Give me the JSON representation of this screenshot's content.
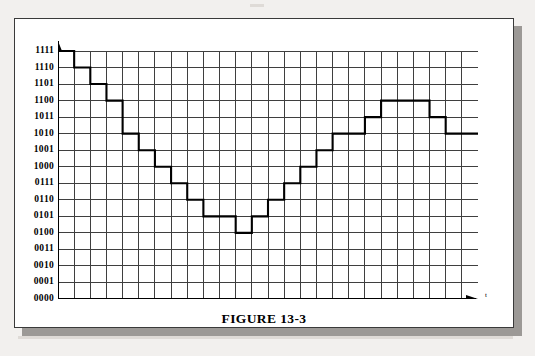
{
  "figure": {
    "caption": "FIGURE 13-3",
    "x_axis_label": "t",
    "y_axis_labels": [
      "1111",
      "1110",
      "1101",
      "1100",
      "1011",
      "1010",
      "1001",
      "1000",
      "0111",
      "0110",
      "0101",
      "0100",
      "0011",
      "0010",
      "0001",
      "0000"
    ],
    "colors": {
      "ink": "#000000",
      "grid": "#3f3f3f",
      "page": "#ffffff",
      "backdrop": "#f2f0ee",
      "shadow": "#8d8a86"
    }
  },
  "chart_data": {
    "type": "line",
    "title": "FIGURE 13-3",
    "subtitle": "",
    "xlabel": "t",
    "ylabel": "",
    "grid": true,
    "legend": null,
    "step_style": "post",
    "note": "4-bit quantized (staircase) reconstruction of an analog waveform; y tick labels are 4-bit binary codes 0000-1111 (decimal 0-15).",
    "ylim": [
      0,
      15
    ],
    "xlim": [
      0,
      26
    ],
    "ytick_labels": [
      "0000",
      "0001",
      "0010",
      "0011",
      "0100",
      "0101",
      "0110",
      "0111",
      "1000",
      "1001",
      "1010",
      "1011",
      "1100",
      "1101",
      "1110",
      "1111"
    ],
    "ytick_values": [
      0,
      1,
      2,
      3,
      4,
      5,
      6,
      7,
      8,
      9,
      10,
      11,
      12,
      13,
      14,
      15
    ],
    "x": [
      0,
      1,
      2,
      3,
      4,
      5,
      6,
      7,
      8,
      9,
      10,
      11,
      12,
      13,
      14,
      15,
      16,
      17,
      18,
      19,
      20,
      21,
      22,
      23,
      24,
      25,
      26
    ],
    "values": [
      15,
      14,
      13,
      12,
      10,
      9,
      8,
      7,
      6,
      5,
      5,
      4,
      5,
      6,
      7,
      8,
      9,
      10,
      10,
      11,
      12,
      12,
      12,
      11,
      10,
      10,
      10
    ],
    "binary_values": [
      "1111",
      "1110",
      "1101",
      "1100",
      "1010",
      "1001",
      "1000",
      "0111",
      "0110",
      "0101",
      "0101",
      "0100",
      "0101",
      "0110",
      "0111",
      "1000",
      "1001",
      "1010",
      "1010",
      "1011",
      "1100",
      "1100",
      "1100",
      "1011",
      "1010",
      "1010",
      "1010"
    ]
  }
}
